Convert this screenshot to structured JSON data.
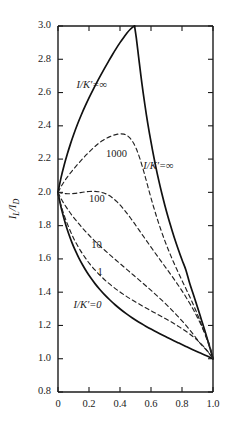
{
  "chart_data": {
    "type": "line",
    "title": "",
    "subtitle": "",
    "xlabel": "",
    "ylabel": "IL/ID",
    "xlim": [
      0.0,
      1.0
    ],
    "ylim": [
      0.8,
      3.0
    ],
    "grid": false,
    "legend_position": "inline-annotations",
    "x_ticks": [
      "0",
      "0.2",
      "0.4",
      "0.6",
      "0.8",
      "1.0"
    ],
    "x_tick_values": [
      0.0,
      0.2,
      0.4,
      0.6,
      0.8,
      1.0
    ],
    "y_ticks": [
      "0.8",
      "1.0",
      "1.2",
      "1.4",
      "1.6",
      "1.8",
      "2.0",
      "2.2",
      "2.4",
      "2.6",
      "2.8",
      "3.0"
    ],
    "y_tick_values": [
      0.8,
      1.0,
      1.2,
      1.4,
      1.6,
      1.8,
      2.0,
      2.2,
      2.4,
      2.6,
      2.8,
      3.0
    ],
    "annotations": [
      {
        "id": "ann-inf-upper",
        "text": "I/K′=∞",
        "x": 0.12,
        "y": 2.63
      },
      {
        "id": "ann-1000",
        "text": "1000",
        "x": 0.31,
        "y": 2.21
      },
      {
        "id": "ann-inf-right",
        "text": "I/K′=∞",
        "x": 0.55,
        "y": 2.14
      },
      {
        "id": "ann-100",
        "text": "100",
        "x": 0.2,
        "y": 1.94
      },
      {
        "id": "ann-10",
        "text": "10",
        "x": 0.215,
        "y": 1.665
      },
      {
        "id": "ann-1",
        "text": "1",
        "x": 0.255,
        "y": 1.505
      },
      {
        "id": "ann-zero",
        "text": "I/K′=0",
        "x": 0.1,
        "y": 1.305
      }
    ],
    "series": [
      {
        "name": "I/K'=∞ (upper branch)",
        "style": "solid",
        "points": [
          [
            0.0,
            2.0
          ],
          [
            0.02,
            2.09
          ],
          [
            0.04,
            2.165
          ],
          [
            0.06,
            2.23
          ],
          [
            0.08,
            2.29
          ],
          [
            0.1,
            2.345
          ],
          [
            0.125,
            2.408
          ],
          [
            0.15,
            2.465
          ],
          [
            0.175,
            2.518
          ],
          [
            0.2,
            2.568
          ],
          [
            0.225,
            2.615
          ],
          [
            0.25,
            2.66
          ],
          [
            0.275,
            2.703
          ],
          [
            0.3,
            2.745
          ],
          [
            0.325,
            2.786
          ],
          [
            0.35,
            2.826
          ],
          [
            0.375,
            2.864
          ],
          [
            0.4,
            2.9
          ],
          [
            0.425,
            2.933
          ],
          [
            0.445,
            2.958
          ],
          [
            0.465,
            2.979
          ],
          [
            0.482,
            2.993
          ],
          [
            0.494,
            3.0
          ]
        ]
      },
      {
        "name": "I/K'=∞ (descending branch)",
        "style": "solid",
        "points": [
          [
            0.494,
            3.0
          ],
          [
            0.505,
            2.93
          ],
          [
            0.52,
            2.815
          ],
          [
            0.535,
            2.7
          ],
          [
            0.55,
            2.595
          ],
          [
            0.57,
            2.468
          ],
          [
            0.59,
            2.355
          ],
          [
            0.61,
            2.252
          ],
          [
            0.63,
            2.158
          ],
          [
            0.65,
            2.072
          ],
          [
            0.67,
            1.993
          ],
          [
            0.69,
            1.92
          ],
          [
            0.71,
            1.852
          ],
          [
            0.73,
            1.789
          ],
          [
            0.75,
            1.729
          ],
          [
            0.775,
            1.66
          ],
          [
            0.8,
            1.595
          ],
          [
            0.825,
            1.534
          ],
          [
            0.85,
            1.452
          ],
          [
            0.875,
            1.382
          ],
          [
            0.9,
            1.31
          ],
          [
            0.925,
            1.235
          ],
          [
            0.95,
            1.16
          ],
          [
            0.97,
            1.098
          ],
          [
            0.985,
            1.05
          ],
          [
            1.0,
            1.0
          ]
        ]
      },
      {
        "name": "I/K'=0",
        "style": "solid",
        "points": [
          [
            0.0,
            2.0
          ],
          [
            0.015,
            1.93
          ],
          [
            0.03,
            1.872
          ],
          [
            0.05,
            1.805
          ],
          [
            0.07,
            1.748
          ],
          [
            0.09,
            1.698
          ],
          [
            0.11,
            1.654
          ],
          [
            0.135,
            1.605
          ],
          [
            0.16,
            1.562
          ],
          [
            0.185,
            1.523
          ],
          [
            0.21,
            1.488
          ],
          [
            0.24,
            1.45
          ],
          [
            0.27,
            1.416
          ],
          [
            0.3,
            1.385
          ],
          [
            0.335,
            1.353
          ],
          [
            0.37,
            1.323
          ],
          [
            0.405,
            1.296
          ],
          [
            0.44,
            1.271
          ],
          [
            0.48,
            1.245
          ],
          [
            0.52,
            1.221
          ],
          [
            0.56,
            1.199
          ],
          [
            0.6,
            1.178
          ],
          [
            0.645,
            1.156
          ],
          [
            0.69,
            1.135
          ],
          [
            0.735,
            1.114
          ],
          [
            0.78,
            1.094
          ],
          [
            0.825,
            1.074
          ],
          [
            0.87,
            1.054
          ],
          [
            0.91,
            1.037
          ],
          [
            0.95,
            1.021
          ],
          [
            0.98,
            1.008
          ],
          [
            1.0,
            1.0
          ]
        ]
      },
      {
        "name": "1000",
        "style": "dashed",
        "points": [
          [
            0.0,
            2.0
          ],
          [
            0.02,
            2.035
          ],
          [
            0.04,
            2.065
          ],
          [
            0.06,
            2.092
          ],
          [
            0.085,
            2.122
          ],
          [
            0.11,
            2.15
          ],
          [
            0.135,
            2.177
          ],
          [
            0.16,
            2.203
          ],
          [
            0.185,
            2.228
          ],
          [
            0.21,
            2.251
          ],
          [
            0.235,
            2.273
          ],
          [
            0.26,
            2.293
          ],
          [
            0.285,
            2.31
          ],
          [
            0.31,
            2.324
          ],
          [
            0.335,
            2.335
          ],
          [
            0.36,
            2.344
          ],
          [
            0.385,
            2.35
          ],
          [
            0.405,
            2.352
          ],
          [
            0.425,
            2.35
          ],
          [
            0.445,
            2.342
          ],
          [
            0.465,
            2.326
          ],
          [
            0.485,
            2.3
          ],
          [
            0.505,
            2.262
          ],
          [
            0.525,
            2.212
          ],
          [
            0.545,
            2.152
          ],
          [
            0.565,
            2.086
          ],
          [
            0.59,
            2.0
          ],
          [
            0.615,
            1.918
          ],
          [
            0.64,
            1.842
          ],
          [
            0.665,
            1.772
          ],
          [
            0.69,
            1.707
          ],
          [
            0.715,
            1.648
          ],
          [
            0.74,
            1.592
          ],
          [
            0.77,
            1.53
          ],
          [
            0.8,
            1.47
          ],
          [
            0.83,
            1.412
          ],
          [
            0.86,
            1.352
          ],
          [
            0.89,
            1.288
          ],
          [
            0.92,
            1.218
          ],
          [
            0.945,
            1.155
          ],
          [
            0.97,
            1.092
          ],
          [
            0.987,
            1.045
          ],
          [
            1.0,
            1.0
          ]
        ]
      },
      {
        "name": "100",
        "style": "dashed",
        "points": [
          [
            0.0,
            2.0
          ],
          [
            0.025,
            1.995
          ],
          [
            0.05,
            1.992
          ],
          [
            0.08,
            1.992
          ],
          [
            0.11,
            1.994
          ],
          [
            0.14,
            1.998
          ],
          [
            0.17,
            2.002
          ],
          [
            0.2,
            2.005
          ],
          [
            0.23,
            2.006
          ],
          [
            0.26,
            2.004
          ],
          [
            0.29,
            1.998
          ],
          [
            0.32,
            1.986
          ],
          [
            0.35,
            1.968
          ],
          [
            0.38,
            1.944
          ],
          [
            0.41,
            1.914
          ],
          [
            0.44,
            1.88
          ],
          [
            0.47,
            1.843
          ],
          [
            0.5,
            1.804
          ],
          [
            0.53,
            1.764
          ],
          [
            0.56,
            1.724
          ],
          [
            0.59,
            1.684
          ],
          [
            0.625,
            1.638
          ],
          [
            0.66,
            1.593
          ],
          [
            0.695,
            1.548
          ],
          [
            0.73,
            1.503
          ],
          [
            0.765,
            1.456
          ],
          [
            0.8,
            1.408
          ],
          [
            0.835,
            1.356
          ],
          [
            0.87,
            1.3
          ],
          [
            0.9,
            1.247
          ],
          [
            0.93,
            1.19
          ],
          [
            0.955,
            1.137
          ],
          [
            0.978,
            1.082
          ],
          [
            1.0,
            1.0
          ]
        ]
      },
      {
        "name": "10",
        "style": "dashed",
        "points": [
          [
            0.0,
            2.0
          ],
          [
            0.02,
            1.962
          ],
          [
            0.04,
            1.93
          ],
          [
            0.065,
            1.895
          ],
          [
            0.09,
            1.862
          ],
          [
            0.12,
            1.827
          ],
          [
            0.15,
            1.794
          ],
          [
            0.18,
            1.763
          ],
          [
            0.21,
            1.733
          ],
          [
            0.245,
            1.701
          ],
          [
            0.28,
            1.67
          ],
          [
            0.315,
            1.641
          ],
          [
            0.35,
            1.612
          ],
          [
            0.385,
            1.584
          ],
          [
            0.42,
            1.556
          ],
          [
            0.455,
            1.528
          ],
          [
            0.49,
            1.5
          ],
          [
            0.53,
            1.468
          ],
          [
            0.57,
            1.436
          ],
          [
            0.61,
            1.403
          ],
          [
            0.65,
            1.369
          ],
          [
            0.69,
            1.334
          ],
          [
            0.73,
            1.297
          ],
          [
            0.77,
            1.258
          ],
          [
            0.81,
            1.217
          ],
          [
            0.85,
            1.173
          ],
          [
            0.885,
            1.132
          ],
          [
            0.92,
            1.089
          ],
          [
            0.95,
            1.06
          ],
          [
            0.975,
            1.032
          ],
          [
            1.0,
            1.0
          ]
        ]
      },
      {
        "name": "1",
        "style": "dashed",
        "points": [
          [
            0.0,
            1.988
          ],
          [
            0.02,
            1.92
          ],
          [
            0.04,
            1.862
          ],
          [
            0.065,
            1.8
          ],
          [
            0.09,
            1.745
          ],
          [
            0.115,
            1.698
          ],
          [
            0.145,
            1.65
          ],
          [
            0.175,
            1.608
          ],
          [
            0.205,
            1.57
          ],
          [
            0.24,
            1.532
          ],
          [
            0.275,
            1.498
          ],
          [
            0.31,
            1.467
          ],
          [
            0.35,
            1.436
          ],
          [
            0.39,
            1.408
          ],
          [
            0.43,
            1.382
          ],
          [
            0.47,
            1.358
          ],
          [
            0.515,
            1.333
          ],
          [
            0.56,
            1.309
          ],
          [
            0.605,
            1.286
          ],
          [
            0.65,
            1.263
          ],
          [
            0.695,
            1.24
          ],
          [
            0.74,
            1.216
          ],
          [
            0.785,
            1.19
          ],
          [
            0.83,
            1.162
          ],
          [
            0.87,
            1.134
          ],
          [
            0.905,
            1.106
          ],
          [
            0.94,
            1.073
          ],
          [
            0.97,
            1.04
          ],
          [
            1.0,
            1.0
          ]
        ]
      }
    ]
  },
  "axis_title": {
    "y_label_main": "I",
    "y_label_sub1": "L",
    "y_label_slash": "/I",
    "y_label_sub2": "D"
  },
  "colors": {
    "ink": "#1b1b1b",
    "background": "#ffffff",
    "solid_curve": "#111111",
    "dashed_curve": "#222222"
  }
}
